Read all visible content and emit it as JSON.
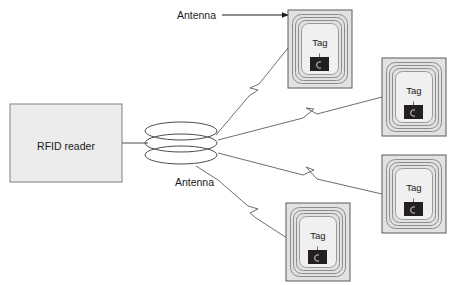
{
  "diagram": {
    "type": "rfid-system-block-diagram",
    "background_color": "#ffffff",
    "reader": {
      "label": "RFID reader",
      "fill_color": "#ececec",
      "border_color": "#808080",
      "x": 10,
      "y": 104,
      "width": 112,
      "height": 78
    },
    "antenna": {
      "name": "reader-antenna-coil",
      "description": "stacked elliptical coil",
      "loops": 3,
      "center_x": 181,
      "center_y": 143,
      "rx": 36,
      "ry": 9,
      "stroke_color": "#4d4d4d"
    },
    "connector": {
      "name": "reader-to-antenna-wire",
      "from_x": 122,
      "to_x": 147,
      "y": 143
    },
    "labels": [
      {
        "id": "antenna-label-top",
        "text": "Antenna",
        "x": 216,
        "y": 19,
        "leader": {
          "style": "arrow",
          "x1": 268,
          "y1": 15,
          "x2": 288,
          "y2": 15
        }
      },
      {
        "id": "antenna-label-bottom",
        "text": "Antenna",
        "x": 169,
        "y": 185,
        "leader": {
          "style": "line",
          "x1": 218,
          "y1": 180,
          "x2": 245,
          "y2": 196
        }
      }
    ],
    "tags": [
      {
        "id": "tag-top-center",
        "label": "Tag",
        "x": 288,
        "y": 10,
        "width": 64,
        "height": 78
      },
      {
        "id": "tag-right-upper",
        "label": "Tag",
        "x": 382,
        "y": 58,
        "width": 64,
        "height": 78
      },
      {
        "id": "tag-right-lower",
        "label": "Tag",
        "x": 382,
        "y": 155,
        "width": 64,
        "height": 78
      },
      {
        "id": "tag-bottom-center",
        "label": "Tag",
        "x": 286,
        "y": 203,
        "width": 64,
        "height": 78
      }
    ],
    "tag_style": {
      "outer_fill": "#e2e2e2",
      "outer_border": "#5a5a5a",
      "coil_stroke": "#8c8c8c",
      "inner_fill": "#f0f0f0",
      "inner_border": "#9a9a9a",
      "chip_fill": "#231f20",
      "coil_turns": 3
    },
    "signal_links": [
      {
        "id": "signal-to-tag-top-center",
        "from_x": 216,
        "from_y": 135,
        "to_x": 288,
        "to_y": 48,
        "bolt_t": 0.46
      },
      {
        "id": "signal-to-tag-right-upper",
        "from_x": 218,
        "from_y": 140,
        "to_x": 382,
        "to_y": 97,
        "bolt_t": 0.5
      },
      {
        "id": "signal-to-tag-right-lower",
        "from_x": 218,
        "from_y": 153,
        "to_x": 382,
        "to_y": 194,
        "bolt_t": 0.48
      },
      {
        "id": "signal-to-tag-bottom-center",
        "from_x": 218,
        "from_y": 180,
        "to_x": 290,
        "to_y": 240,
        "bolt_t": 0.47
      }
    ]
  }
}
